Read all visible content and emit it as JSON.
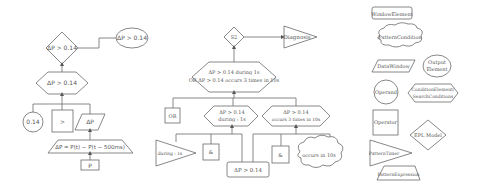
{
  "left_diagram": {
    "decision_diamond": "ΔP > 0.14",
    "output_ellipse": "ΔP > 0.14",
    "condition_hexagon": "ΔP > 0.14",
    "operand_circle": "0.14",
    "operator_box": ">",
    "window_parallelogram": "ΔP",
    "expression_trapezoid": "ΔP = P(t) − P(t − 500ms)",
    "input_box": "P"
  },
  "middle_diagram": {
    "model_diamond": "S2",
    "output_triangle": "Diagnosis",
    "main_hexagon_line1": "ΔP > 0.14 during 1s",
    "main_hexagon_line2": "OR ΔP > 0.14 occurs 3 times in 10s",
    "or_box": "OR",
    "hex_left_line1": "ΔP > 0.14",
    "hex_left_line2": "during : 1s",
    "hex_right_line1": "ΔP > 0.14",
    "hex_right_line2": "occurs 3 times in 10s",
    "timer_triangle": "during : 1s",
    "and_box_left": "&",
    "and_box_right": "&",
    "shared_condition_box": "ΔP > 0.14",
    "cloud_condition": "occurs in 10s"
  },
  "legend": {
    "title": "",
    "items": [
      {
        "shape": "rounded-rect",
        "label": "WindowElement"
      },
      {
        "shape": "cloud",
        "label": "PatternCondition"
      },
      {
        "shape": "parallelogram",
        "label": "DataWindow"
      },
      {
        "shape": "ellipse",
        "label_line1": "Output",
        "label_line2": "Element"
      },
      {
        "shape": "circle",
        "label": "Operand"
      },
      {
        "shape": "hexagon",
        "label_line1": "ConditionElement/",
        "label_line2": "SearchConditions"
      },
      {
        "shape": "square",
        "label": "Operator"
      },
      {
        "shape": "diamond",
        "label": "EPL Model"
      },
      {
        "shape": "triangle",
        "label": "PatternTimer"
      },
      {
        "shape": "trapezoid",
        "label": "PatternExpression"
      }
    ]
  }
}
